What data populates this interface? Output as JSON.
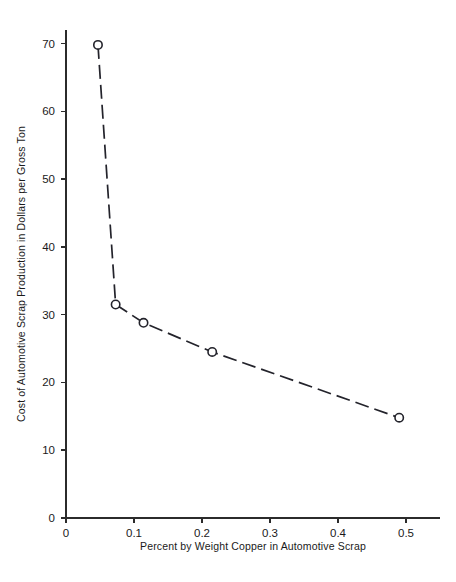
{
  "chart_data": {
    "type": "line",
    "title": "",
    "xlabel": "Percent by Weight Copper in  Automotive Scrap",
    "ylabel": "Cost of Automotive Scrap Production in Dollars per Gross Ton",
    "xlim": [
      0,
      0.55
    ],
    "ylim": [
      0,
      72
    ],
    "grid": false,
    "legend": "none",
    "marker": "open-circle",
    "linestyle": "dashed",
    "series": [
      {
        "name": "Cost vs Copper Content",
        "x": [
          0.047,
          0.073,
          0.114,
          0.215,
          0.49
        ],
        "y": [
          69.8,
          31.5,
          28.8,
          24.5,
          14.8
        ]
      }
    ],
    "x_ticks": [
      {
        "value": 0,
        "label": "0"
      },
      {
        "value": 0.1,
        "label": "0.1"
      },
      {
        "value": 0.2,
        "label": "0.2"
      },
      {
        "value": 0.3,
        "label": "0.3"
      },
      {
        "value": 0.4,
        "label": "0.4"
      },
      {
        "value": 0.5,
        "label": "0.5"
      }
    ],
    "y_ticks": [
      {
        "value": 0,
        "label": "0"
      },
      {
        "value": 10,
        "label": "10"
      },
      {
        "value": 20,
        "label": "20"
      },
      {
        "value": 30,
        "label": "30"
      },
      {
        "value": 40,
        "label": "40"
      },
      {
        "value": 50,
        "label": "50"
      },
      {
        "value": 60,
        "label": "60"
      },
      {
        "value": 70,
        "label": "70"
      }
    ],
    "colors": {
      "line": "#23232b",
      "marker_fill": "#ffffff",
      "marker_stroke": "#23232b",
      "axis": "#2b2b2b",
      "text": "#1a1a1a",
      "background": "#ffffff"
    }
  }
}
